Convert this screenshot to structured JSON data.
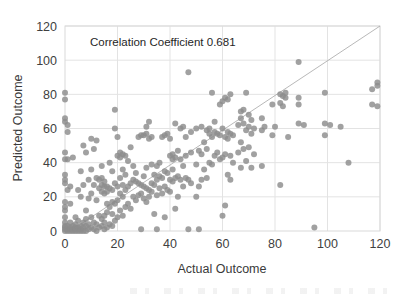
{
  "chart_data": {
    "type": "scatter",
    "title": "",
    "annotation": "Correlation Coefficient 0.681",
    "correlation_coefficient": 0.681,
    "xlabel": "Actual Outcome",
    "ylabel": "Predicted Outcome",
    "xlim": [
      0,
      120
    ],
    "ylim": [
      0,
      120
    ],
    "xticks": [
      0,
      20,
      40,
      60,
      80,
      100,
      120
    ],
    "yticks": [
      0,
      20,
      40,
      60,
      80,
      100,
      120
    ],
    "xtick_labels": [
      "0",
      "20",
      "40",
      "60",
      "80",
      "100",
      "120"
    ],
    "ytick_labels": [
      "0",
      "20",
      "40",
      "60",
      "80",
      "100",
      "120"
    ],
    "grid": true,
    "legend": null,
    "legend_position": "none",
    "marker": {
      "shape": "circle",
      "color": "#8c8c8c",
      "size": 3.0
    },
    "reference_line": {
      "label": "identity line y = x",
      "color": "#a6a6a6",
      "width": 0.8,
      "x": [
        5,
        120
      ],
      "y": [
        3,
        122
      ]
    },
    "colors": {
      "marker": "#8c8c8c",
      "gridline": "#e3e3e3",
      "axis_border": "#d9d9d9",
      "text": "#404040",
      "background": "#ffffff",
      "reference_line": "#a6a6a6"
    },
    "n_points": 248,
    "points": [
      [
        0,
        0
      ],
      [
        0,
        1
      ],
      [
        0,
        2
      ],
      [
        0,
        3
      ],
      [
        0,
        5
      ],
      [
        0,
        8
      ],
      [
        0,
        12
      ],
      [
        0,
        14
      ],
      [
        0,
        17
      ],
      [
        0,
        28
      ],
      [
        0,
        30
      ],
      [
        0,
        33
      ],
      [
        0,
        42
      ],
      [
        0,
        46
      ],
      [
        0,
        64
      ],
      [
        0,
        66
      ],
      [
        0,
        77
      ],
      [
        0,
        81
      ],
      [
        1,
        0
      ],
      [
        1,
        1
      ],
      [
        1,
        3
      ],
      [
        1,
        24
      ],
      [
        1,
        42
      ],
      [
        1,
        58
      ],
      [
        1,
        62
      ],
      [
        2,
        0
      ],
      [
        2,
        1
      ],
      [
        2,
        2
      ],
      [
        2,
        5
      ],
      [
        2,
        16
      ],
      [
        2,
        26
      ],
      [
        3,
        0
      ],
      [
        3,
        1
      ],
      [
        3,
        3
      ],
      [
        3,
        43
      ],
      [
        4,
        0
      ],
      [
        4,
        1
      ],
      [
        4,
        2
      ],
      [
        4,
        4
      ],
      [
        4,
        8
      ],
      [
        5,
        0
      ],
      [
        5,
        1
      ],
      [
        5,
        2
      ],
      [
        5,
        6
      ],
      [
        5,
        24
      ],
      [
        6,
        0
      ],
      [
        6,
        1
      ],
      [
        6,
        3
      ],
      [
        6,
        20
      ],
      [
        6,
        35
      ],
      [
        7,
        0
      ],
      [
        7,
        2
      ],
      [
        7,
        5
      ],
      [
        7,
        27
      ],
      [
        7,
        50
      ],
      [
        8,
        0
      ],
      [
        8,
        3
      ],
      [
        8,
        7
      ],
      [
        8,
        12
      ],
      [
        8,
        46
      ],
      [
        9,
        1
      ],
      [
        9,
        4
      ],
      [
        9,
        19
      ],
      [
        9,
        30
      ],
      [
        10,
        2
      ],
      [
        10,
        8
      ],
      [
        10,
        22
      ],
      [
        10,
        36
      ],
      [
        10,
        54
      ],
      [
        11,
        1
      ],
      [
        11,
        5
      ],
      [
        11,
        27
      ],
      [
        11,
        48
      ],
      [
        12,
        0
      ],
      [
        12,
        4
      ],
      [
        12,
        18
      ],
      [
        12,
        31
      ],
      [
        12,
        53
      ],
      [
        13,
        2
      ],
      [
        13,
        9
      ],
      [
        13,
        25
      ],
      [
        13,
        30
      ],
      [
        14,
        3
      ],
      [
        14,
        7
      ],
      [
        14,
        23
      ],
      [
        14,
        27
      ],
      [
        14,
        31
      ],
      [
        14,
        38
      ],
      [
        15,
        1
      ],
      [
        15,
        5
      ],
      [
        15,
        9
      ],
      [
        15,
        22
      ],
      [
        15,
        26
      ],
      [
        15,
        29
      ],
      [
        16,
        2
      ],
      [
        16,
        11
      ],
      [
        16,
        16
      ],
      [
        16,
        23
      ],
      [
        16,
        26
      ],
      [
        17,
        4
      ],
      [
        17,
        14
      ],
      [
        17,
        25
      ],
      [
        17,
        40
      ],
      [
        18,
        3
      ],
      [
        18,
        10
      ],
      [
        18,
        17
      ],
      [
        18,
        24
      ],
      [
        18,
        35
      ],
      [
        19,
        6
      ],
      [
        19,
        16
      ],
      [
        19,
        28
      ],
      [
        19,
        60
      ],
      [
        19,
        71
      ],
      [
        20,
        8
      ],
      [
        20,
        18
      ],
      [
        20,
        26
      ],
      [
        20,
        44
      ],
      [
        20,
        55
      ],
      [
        21,
        12
      ],
      [
        21,
        22
      ],
      [
        21,
        31
      ],
      [
        21,
        43
      ],
      [
        21,
        46
      ],
      [
        22,
        9
      ],
      [
        22,
        20
      ],
      [
        22,
        27
      ],
      [
        22,
        36
      ],
      [
        22,
        45
      ],
      [
        23,
        14
      ],
      [
        23,
        24
      ],
      [
        23,
        33
      ],
      [
        23,
        44
      ],
      [
        24,
        16
      ],
      [
        24,
        26
      ],
      [
        24,
        41
      ],
      [
        25,
        13
      ],
      [
        25,
        28
      ],
      [
        25,
        49
      ],
      [
        26,
        20
      ],
      [
        26,
        30
      ],
      [
        26,
        38
      ],
      [
        27,
        18
      ],
      [
        27,
        29
      ],
      [
        27,
        34
      ],
      [
        28,
        21
      ],
      [
        28,
        28
      ],
      [
        28,
        55
      ],
      [
        29,
        1
      ],
      [
        29,
        22
      ],
      [
        29,
        27
      ],
      [
        29,
        56
      ],
      [
        30,
        19
      ],
      [
        30,
        26
      ],
      [
        30,
        32
      ],
      [
        30,
        56
      ],
      [
        31,
        17
      ],
      [
        31,
        25
      ],
      [
        31,
        37
      ],
      [
        31,
        57
      ],
      [
        31,
        61
      ],
      [
        32,
        20
      ],
      [
        32,
        24
      ],
      [
        32,
        54
      ],
      [
        32,
        64
      ],
      [
        33,
        23
      ],
      [
        33,
        28
      ],
      [
        33,
        39
      ],
      [
        33,
        55
      ],
      [
        34,
        10
      ],
      [
        34,
        27
      ],
      [
        34,
        33
      ],
      [
        35,
        1
      ],
      [
        35,
        21
      ],
      [
        35,
        30
      ],
      [
        35,
        38
      ],
      [
        36,
        25
      ],
      [
        36,
        32
      ],
      [
        36,
        40
      ],
      [
        37,
        22
      ],
      [
        37,
        31
      ],
      [
        37,
        55
      ],
      [
        38,
        8
      ],
      [
        38,
        26
      ],
      [
        38,
        35
      ],
      [
        38,
        56
      ],
      [
        39,
        24
      ],
      [
        39,
        34
      ],
      [
        39,
        57
      ],
      [
        40,
        23
      ],
      [
        40,
        30
      ],
      [
        40,
        44
      ],
      [
        40,
        54
      ],
      [
        41,
        29
      ],
      [
        41,
        36
      ],
      [
        41,
        42
      ],
      [
        41,
        45
      ],
      [
        42,
        13
      ],
      [
        42,
        31
      ],
      [
        42,
        43
      ],
      [
        42,
        63
      ],
      [
        43,
        20
      ],
      [
        43,
        32
      ],
      [
        43,
        47
      ],
      [
        44,
        30
      ],
      [
        44,
        42
      ],
      [
        44,
        60
      ],
      [
        45,
        26
      ],
      [
        45,
        38
      ],
      [
        45,
        61
      ],
      [
        46,
        31
      ],
      [
        46,
        44
      ],
      [
        46,
        55
      ],
      [
        47,
        1
      ],
      [
        47,
        30
      ],
      [
        47,
        93
      ],
      [
        48,
        28
      ],
      [
        48,
        46
      ],
      [
        48,
        58
      ],
      [
        50,
        20
      ],
      [
        50,
        39
      ],
      [
        50,
        60
      ],
      [
        51,
        1
      ],
      [
        51,
        26
      ],
      [
        51,
        47
      ],
      [
        52,
        30
      ],
      [
        52,
        45
      ],
      [
        52,
        61
      ],
      [
        53,
        36
      ],
      [
        53,
        52
      ],
      [
        54,
        31
      ],
      [
        54,
        48
      ],
      [
        54,
        59
      ],
      [
        55,
        40
      ],
      [
        55,
        57
      ],
      [
        55,
        60
      ],
      [
        56,
        39
      ],
      [
        56,
        55
      ],
      [
        56,
        81
      ],
      [
        57,
        44
      ],
      [
        57,
        58
      ],
      [
        57,
        64
      ],
      [
        58,
        46
      ],
      [
        58,
        57
      ],
      [
        59,
        42
      ],
      [
        59,
        56
      ],
      [
        59,
        74
      ],
      [
        60,
        9
      ],
      [
        60,
        43
      ],
      [
        60,
        60
      ],
      [
        60,
        76
      ],
      [
        61,
        15
      ],
      [
        61,
        45
      ],
      [
        61,
        55
      ],
      [
        61,
        78
      ],
      [
        62,
        33
      ],
      [
        62,
        54
      ],
      [
        62,
        58
      ],
      [
        62,
        77
      ],
      [
        63,
        30
      ],
      [
        63,
        44
      ],
      [
        63,
        57
      ],
      [
        63,
        80
      ],
      [
        64,
        40
      ],
      [
        64,
        56
      ],
      [
        66,
        46
      ],
      [
        66,
        62
      ],
      [
        67,
        37
      ],
      [
        67,
        52
      ],
      [
        67,
        66
      ],
      [
        67,
        70
      ],
      [
        68,
        48
      ],
      [
        68,
        63
      ],
      [
        68,
        71
      ],
      [
        69,
        41
      ],
      [
        69,
        59
      ],
      [
        69,
        81
      ],
      [
        70,
        49
      ],
      [
        70,
        61
      ],
      [
        70,
        68
      ],
      [
        71,
        37
      ],
      [
        71,
        57
      ],
      [
        71,
        65
      ],
      [
        72,
        45
      ],
      [
        72,
        60
      ],
      [
        75,
        38
      ],
      [
        75,
        59
      ],
      [
        75,
        66
      ],
      [
        76,
        61
      ],
      [
        79,
        56
      ],
      [
        79,
        74
      ],
      [
        80,
        61
      ],
      [
        82,
        27
      ],
      [
        82,
        75
      ],
      [
        82,
        80
      ],
      [
        83,
        73
      ],
      [
        83,
        79
      ],
      [
        84,
        78
      ],
      [
        84,
        81
      ],
      [
        85,
        55
      ],
      [
        89,
        63
      ],
      [
        89,
        74
      ],
      [
        89,
        78
      ],
      [
        89,
        99
      ],
      [
        91,
        62
      ],
      [
        95,
        2
      ],
      [
        99,
        56
      ],
      [
        99,
        63
      ],
      [
        99,
        81
      ],
      [
        101,
        62
      ],
      [
        105,
        61
      ],
      [
        108,
        40
      ],
      [
        117,
        74
      ],
      [
        117,
        83
      ],
      [
        119,
        73
      ],
      [
        119,
        85
      ],
      [
        119,
        87
      ]
    ]
  },
  "annotations": {
    "correlation_text": "Correlation Coefficient 0.681"
  },
  "axes": {
    "x_title": "Actual Outcome",
    "y_title": "Predicted Outcome"
  }
}
